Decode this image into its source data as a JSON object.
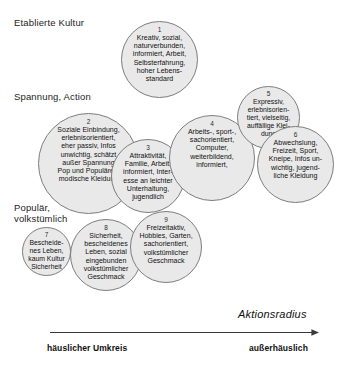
{
  "diagram": {
    "title_axis_x": "Aktionsradius",
    "axis_ends": {
      "left": "häuslicher Umkreis",
      "right": "außerhäuslich"
    },
    "y_labels": [
      {
        "text": "Etablierte Kultur"
      },
      {
        "text": "Spannung, Action"
      },
      {
        "text": "Populär,\nvolkstümlich"
      }
    ],
    "bubbles": [
      {
        "number": "1",
        "text": "Kreativ, sozial,\nnaturverbunden,\ninformiert, Arbeit,\nSelbsterfahrung,\nhoher Lebens-\nstandard"
      },
      {
        "number": "2",
        "text": "Soziale Einbindung,\nerlebnisorientiert,\neher passiv, Infos\nunwichtig, schätzt\naußer Spannung\nPop und Populäres,\nmodische Kleidung"
      },
      {
        "number": "3",
        "text": "Attraktivität,\nFamilie, Arbeit,\ninformiert, Inter-\nesse an leichter\nUnterhaltung,\njugendlich"
      },
      {
        "number": "4",
        "text": "Arbeits-, sport-,\nsachorientiert,\nComputer,\nweiterbildend,\ninformiert,"
      },
      {
        "number": "5",
        "text": "Expressiv,\nerlebnisorien-\ntiert, vielseitig,\nauffällige Klei-\ndung"
      },
      {
        "number": "6",
        "text": "Abwechslung,\nFreizeit, Sport,\nKneipe, Infos un-\nwichtig, jugend-\nliche Kleidung"
      },
      {
        "number": "7",
        "text": "Bescheide-\nnes Leben,\nkaum Kultur\nSicherheit"
      },
      {
        "number": "8",
        "text": "Sicherheit,\nbescheidenes\nLeben, sozial\neingebunden\nvolkstümlicher\nGeschmack"
      },
      {
        "number": "9",
        "text": "Freizeitaktiv,\nHobbies, Garten,\nsachorientiert,\nvolkstümlicher\nGeschmack"
      }
    ],
    "colors": {
      "bubble_fill": "#e9e9e9",
      "bubble_stroke": "#7d7d7d",
      "axis_line": "#3a3a3a",
      "text": "#101010"
    }
  }
}
